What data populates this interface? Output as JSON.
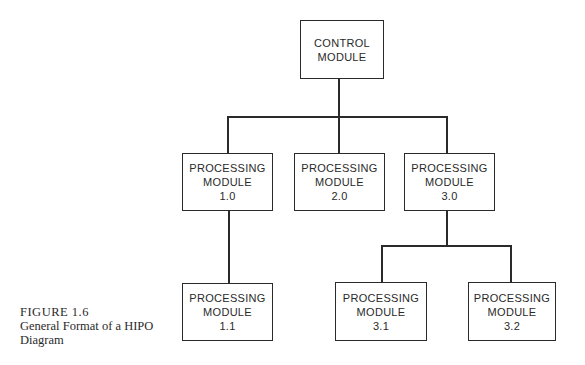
{
  "diagram": {
    "type": "hierarchy",
    "root": {
      "id": "control",
      "lines": [
        "CONTROL",
        "MODULE"
      ],
      "children": [
        {
          "id": "p1_0",
          "lines": [
            "PROCESSING",
            "MODULE",
            "1.0"
          ],
          "children": [
            {
              "id": "p1_1",
              "lines": [
                "PROCESSING",
                "MODULE",
                "1.1"
              ]
            }
          ]
        },
        {
          "id": "p2_0",
          "lines": [
            "PROCESSING",
            "MODULE",
            "2.0"
          ]
        },
        {
          "id": "p3_0",
          "lines": [
            "PROCESSING",
            "MODULE",
            "3.0"
          ],
          "children": [
            {
              "id": "p3_1",
              "lines": [
                "PROCESSING",
                "MODULE",
                "3.1"
              ]
            },
            {
              "id": "p3_2",
              "lines": [
                "PROCESSING",
                "MODULE",
                "3.2"
              ]
            }
          ]
        }
      ]
    }
  },
  "nodes": {
    "control": {
      "l1": "CONTROL",
      "l2": "MODULE"
    },
    "p1_0": {
      "l1": "PROCESSING",
      "l2": "MODULE",
      "l3": "1.0"
    },
    "p2_0": {
      "l1": "PROCESSING",
      "l2": "MODULE",
      "l3": "2.0"
    },
    "p3_0": {
      "l1": "PROCESSING",
      "l2": "MODULE",
      "l3": "3.0"
    },
    "p1_1": {
      "l1": "PROCESSING",
      "l2": "MODULE",
      "l3": "1.1"
    },
    "p3_1": {
      "l1": "PROCESSING",
      "l2": "MODULE",
      "l3": "3.1"
    },
    "p3_2": {
      "l1": "PROCESSING",
      "l2": "MODULE",
      "l3": "3.2"
    }
  },
  "caption": {
    "label": "FIGURE 1.6",
    "line1": "General Format of a HIPO",
    "line2": "Diagram"
  }
}
